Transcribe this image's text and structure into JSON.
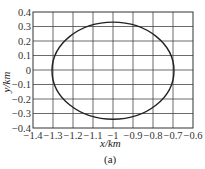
{
  "chart_data": {
    "type": "line",
    "title": "",
    "caption": "(a)",
    "xlabel": "x/km",
    "ylabel": "y/km",
    "xlim": [
      -1.4,
      -0.6
    ],
    "ylim": [
      -0.4,
      0.4
    ],
    "grid": true,
    "xticks": [
      "-1.4",
      "-1.3",
      "-1.2",
      "-1.1",
      "-1",
      "-0.9",
      "-0.8",
      "-0.7",
      "-0.6"
    ],
    "yticks": [
      "0.4",
      "0.3",
      "0.2",
      "0.1",
      "0",
      "-0.1",
      "-0.2",
      "-0.3",
      "-0.4"
    ],
    "series": [
      {
        "name": "closed trajectory (ellipse)",
        "shape": "ellipse",
        "center": [
          -1.0,
          -0.005
        ],
        "semi_axis_x": 0.305,
        "semi_axis_y": 0.335,
        "x": [
          -1.305,
          -1.264,
          -1.153,
          -1.0,
          -0.847,
          -0.736,
          -0.695,
          -0.736,
          -0.847,
          -1.0,
          -1.153,
          -1.264,
          -1.305
        ],
        "y": [
          -0.005,
          0.163,
          0.285,
          0.33,
          0.285,
          0.163,
          -0.005,
          -0.173,
          -0.295,
          -0.34,
          -0.295,
          -0.173,
          -0.005
        ]
      }
    ]
  }
}
